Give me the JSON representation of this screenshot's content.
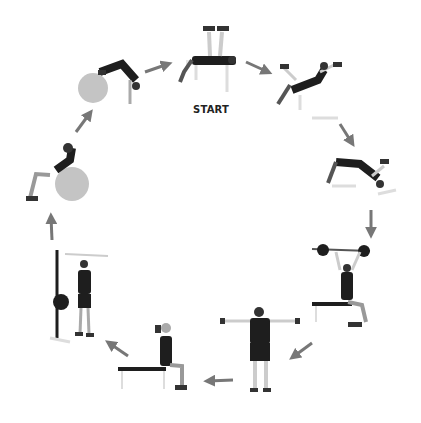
{
  "diagram": {
    "type": "exercise-circuit",
    "start_label": "START",
    "arrow_color": "#777777",
    "figure_color": "#1e1e1e",
    "ball_color": "#bdbdbd",
    "bench_color": "#e0e0e0",
    "stations": [
      {
        "id": 1,
        "name": "dumbbell-bench-press",
        "position": "top-center"
      },
      {
        "id": 2,
        "name": "incline-dumbbell-fly",
        "position": "top-right"
      },
      {
        "id": 3,
        "name": "decline-dumbbell-fly",
        "position": "right-upper"
      },
      {
        "id": 4,
        "name": "seated-barbell-overhead-press",
        "position": "right-lower"
      },
      {
        "id": 5,
        "name": "dumbbell-lateral-raise",
        "position": "bottom-right"
      },
      {
        "id": 6,
        "name": "seated-overhead-triceps-extension",
        "position": "bottom-left"
      },
      {
        "id": 7,
        "name": "cable-curl",
        "position": "left-lower"
      },
      {
        "id": 8,
        "name": "stability-ball-crunch",
        "position": "left-upper"
      },
      {
        "id": 9,
        "name": "stability-ball-pike",
        "position": "top-left"
      }
    ]
  }
}
